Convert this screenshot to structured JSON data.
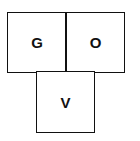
{
  "diagram": {
    "type": "letter-grid",
    "cells": [
      {
        "label": "G",
        "row": 0,
        "col": 0
      },
      {
        "label": "O",
        "row": 0,
        "col": 1
      },
      {
        "label": "V",
        "row": 1,
        "col": 0.5
      }
    ],
    "colors": {
      "stroke": "#111111",
      "fill": "#ffffff",
      "text": "#111111"
    }
  }
}
